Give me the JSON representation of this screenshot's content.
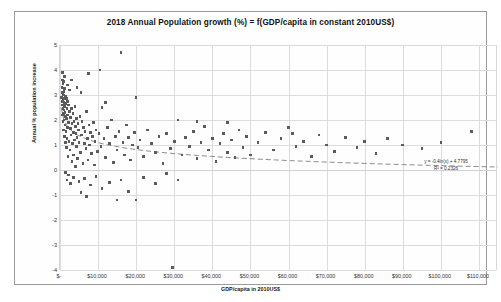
{
  "chart_data": {
    "type": "scatter",
    "title": "2018 Annual Population growth (%) = f(GDP/capita in constant 2010US$)",
    "xlabel": "GDP/capita in 2010US$",
    "ylabel": "Annual % population increase",
    "xlim": [
      0,
      115000
    ],
    "ylim": [
      -4,
      5
    ],
    "xticks": [
      0,
      10000,
      20000,
      30000,
      40000,
      50000,
      60000,
      70000,
      80000,
      90000,
      100000,
      110000
    ],
    "xtick_labels": [
      "$-",
      "$10,000",
      "$20,000",
      "$30,000",
      "$40,000",
      "$50,000",
      "$60,000",
      "$70,000",
      "$80,000",
      "$90,000",
      "$100,000",
      "$110,000"
    ],
    "yticks": [
      5,
      4,
      3,
      2,
      1,
      0,
      -1,
      -2,
      -3,
      -4
    ],
    "ytick_labels": [
      "5",
      "4",
      "3",
      "2",
      "1",
      "0",
      "-1",
      "-2",
      "-3",
      "-4"
    ],
    "grid": true,
    "legend": "none",
    "marker_color": "#5b5b5b",
    "trendline": {
      "type": "logarithmic",
      "style": "dashed",
      "color": "#7a7a7a",
      "equation": "y = -0.4ln(x) + 4.7795",
      "r_squared_label": "R² = 0.2326",
      "slope_ln": -0.4,
      "intercept": 4.7795,
      "r_squared": 0.2326
    },
    "points": [
      [
        400,
        2.9
      ],
      [
        500,
        3.3
      ],
      [
        520,
        2.6
      ],
      [
        600,
        3.6
      ],
      [
        650,
        2.2
      ],
      [
        700,
        3.1
      ],
      [
        720,
        2.75
      ],
      [
        760,
        2.45
      ],
      [
        800,
        3.45
      ],
      [
        820,
        1.95
      ],
      [
        850,
        2.6
      ],
      [
        880,
        3.0
      ],
      [
        900,
        2.25
      ],
      [
        950,
        2.85
      ],
      [
        980,
        1.6
      ],
      [
        1000,
        3.15
      ],
      [
        1020,
        2.4
      ],
      [
        1050,
        2.0
      ],
      [
        1100,
        2.7
      ],
      [
        1150,
        1.35
      ],
      [
        1200,
        2.55
      ],
      [
        1250,
        3.25
      ],
      [
        1300,
        1.8
      ],
      [
        1350,
        2.3
      ],
      [
        1400,
        2.95
      ],
      [
        1450,
        1.1
      ],
      [
        1500,
        2.15
      ],
      [
        1550,
        2.65
      ],
      [
        1600,
        1.55
      ],
      [
        1650,
        2.85
      ],
      [
        1700,
        0.9
      ],
      [
        1750,
        2.05
      ],
      [
        1800,
        2.45
      ],
      [
        1850,
        1.25
      ],
      [
        1900,
        2.75
      ],
      [
        1950,
        1.7
      ],
      [
        2000,
        2.2
      ],
      [
        2100,
        0.55
      ],
      [
        2200,
        1.9
      ],
      [
        2300,
        2.6
      ],
      [
        2400,
        1.15
      ],
      [
        2500,
        2.35
      ],
      [
        2600,
        0.8
      ],
      [
        2700,
        1.65
      ],
      [
        2800,
        2.1
      ],
      [
        2900,
        1.4
      ],
      [
        3000,
        2.45
      ],
      [
        3100,
        0.35
      ],
      [
        3200,
        1.85
      ],
      [
        3300,
        1.05
      ],
      [
        3400,
        2.25
      ],
      [
        3500,
        1.5
      ],
      [
        3600,
        0.6
      ],
      [
        3700,
        1.95
      ],
      [
        3800,
        1.2
      ],
      [
        3900,
        2.55
      ],
      [
        4000,
        0.15
      ],
      [
        4100,
        1.75
      ],
      [
        4200,
        1.45
      ],
      [
        4300,
        0.95
      ],
      [
        4400,
        2.05
      ],
      [
        4500,
        1.3
      ],
      [
        4600,
        0.45
      ],
      [
        4700,
        1.85
      ],
      [
        4800,
        1.6
      ],
      [
        5000,
        1.1
      ],
      [
        5200,
        2.15
      ],
      [
        5400,
        0.7
      ],
      [
        5600,
        1.4
      ],
      [
        5800,
        1.95
      ],
      [
        6000,
        0.25
      ],
      [
        6200,
        1.7
      ],
      [
        6400,
        1.05
      ],
      [
        6600,
        1.55
      ],
      [
        6800,
        0.85
      ],
      [
        7000,
        2.35
      ],
      [
        7200,
        1.25
      ],
      [
        7400,
        0.4
      ],
      [
        7600,
        1.8
      ],
      [
        7800,
        1.0
      ],
      [
        8000,
        1.5
      ],
      [
        8200,
        0.65
      ],
      [
        8500,
        1.35
      ],
      [
        8800,
        1.9
      ],
      [
        9000,
        0.2
      ],
      [
        9200,
        1.15
      ],
      [
        9500,
        1.6
      ],
      [
        9800,
        0.75
      ],
      [
        10200,
        1.45
      ],
      [
        10500,
        4.0
      ],
      [
        10800,
        0.95
      ],
      [
        11000,
        2.5
      ],
      [
        11500,
        1.25
      ],
      [
        12000,
        0.5
      ],
      [
        12500,
        1.7
      ],
      [
        13000,
        1.05
      ],
      [
        13500,
        2.0
      ],
      [
        14000,
        0.3
      ],
      [
        14500,
        1.35
      ],
      [
        15000,
        0.8
      ],
      [
        15500,
        1.55
      ],
      [
        16000,
        4.7
      ],
      [
        16500,
        1.1
      ],
      [
        17000,
        0.6
      ],
      [
        17500,
        1.8
      ],
      [
        18000,
        1.3
      ],
      [
        18500,
        0.4
      ],
      [
        19000,
        1.0
      ],
      [
        19500,
        1.5
      ],
      [
        20000,
        2.9
      ],
      [
        20500,
        0.9
      ],
      [
        21000,
        1.2
      ],
      [
        22000,
        0.55
      ],
      [
        23000,
        1.6
      ],
      [
        24000,
        1.05
      ],
      [
        25000,
        0.7
      ],
      [
        26000,
        1.35
      ],
      [
        27000,
        0.25
      ],
      [
        28000,
        1.45
      ],
      [
        29000,
        0.85
      ],
      [
        30000,
        1.15
      ],
      [
        31000,
        2.0
      ],
      [
        32000,
        0.6
      ],
      [
        33000,
        1.3
      ],
      [
        34000,
        0.95
      ],
      [
        35000,
        1.55
      ],
      [
        36000,
        0.45
      ],
      [
        37000,
        1.1
      ],
      [
        38000,
        1.75
      ],
      [
        39000,
        0.8
      ],
      [
        40000,
        1.25
      ],
      [
        41000,
        0.35
      ],
      [
        42000,
        1.05
      ],
      [
        43000,
        1.45
      ],
      [
        44000,
        0.7
      ],
      [
        45000,
        1.2
      ],
      [
        46000,
        0.5
      ],
      [
        47000,
        1.6
      ],
      [
        48000,
        0.9
      ],
      [
        49000,
        1.35
      ],
      [
        50000,
        0.6
      ],
      [
        52000,
        1.1
      ],
      [
        54000,
        1.5
      ],
      [
        56000,
        0.8
      ],
      [
        58000,
        1.25
      ],
      [
        60000,
        1.7
      ],
      [
        62000,
        0.95
      ],
      [
        64000,
        1.15
      ],
      [
        66000,
        0.55
      ],
      [
        68000,
        1.4
      ],
      [
        70000,
        1.0
      ],
      [
        72000,
        0.75
      ],
      [
        75000,
        1.3
      ],
      [
        78000,
        0.9
      ],
      [
        80000,
        1.15
      ],
      [
        83000,
        0.65
      ],
      [
        86000,
        1.25
      ],
      [
        90000,
        1.0
      ],
      [
        95000,
        0.85
      ],
      [
        100000,
        1.1
      ],
      [
        108000,
        1.55
      ],
      [
        5000,
        -0.45
      ],
      [
        6500,
        -0.35
      ],
      [
        8000,
        -0.6
      ],
      [
        9500,
        -0.25
      ],
      [
        11000,
        -0.75
      ],
      [
        13000,
        -0.5
      ],
      [
        15000,
        -1.2
      ],
      [
        20000,
        -1.2
      ],
      [
        16000,
        -0.4
      ],
      [
        18000,
        -0.85
      ],
      [
        22000,
        -0.3
      ],
      [
        25000,
        -0.55
      ],
      [
        28000,
        -0.15
      ],
      [
        31000,
        -0.4
      ],
      [
        5500,
        -0.9
      ],
      [
        7000,
        -1.05
      ],
      [
        3500,
        -0.3
      ],
      [
        2800,
        -0.55
      ],
      [
        2200,
        -0.2
      ],
      [
        1800,
        -0.4
      ],
      [
        1400,
        -0.1
      ],
      [
        29500,
        -3.9
      ],
      [
        600,
        3.9
      ],
      [
        900,
        3.55
      ],
      [
        1200,
        3.75
      ],
      [
        2000,
        3.4
      ],
      [
        3000,
        3.6
      ],
      [
        4500,
        3.3
      ],
      [
        7500,
        3.85
      ],
      [
        2500,
        3.2
      ],
      [
        5500,
        3.1
      ],
      [
        12000,
        2.7
      ],
      [
        36000,
        1.95
      ],
      [
        44000,
        1.9
      ],
      [
        61000,
        1.45
      ]
    ]
  }
}
